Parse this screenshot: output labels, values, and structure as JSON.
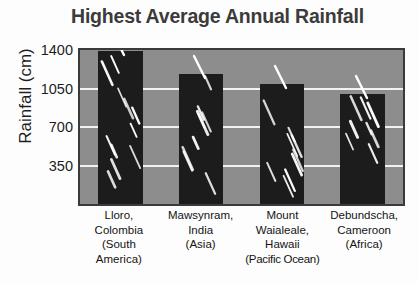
{
  "chart_data": {
    "type": "bar",
    "title": "Highest Average Annual Rainfall",
    "xlabel": "",
    "ylabel": "Rainfall (cm)",
    "ylim": [
      0,
      1400
    ],
    "yticks": [
      350,
      700,
      1050,
      1400
    ],
    "ytick_labels": [
      "350",
      "700",
      "1050",
      "1400"
    ],
    "gridlines": [
      350,
      700,
      1050
    ],
    "grid": true,
    "legend": "none",
    "categories": [
      "Lloro, Colombia (South America)",
      "Mawsynram, India (Asia)",
      "Mount Waialeale, Hawaii (Pacific Ocean)",
      "Debundscha, Cameroon (Africa)"
    ],
    "values": [
      1390,
      1180,
      1090,
      1000
    ],
    "bar_fill_color": "#1c1c1c",
    "plot_background_color": "#8d8d8d",
    "gridline_color": "#f2f2f2",
    "title_color": "#3b3b3b"
  },
  "axis": {
    "y_title": "Rainfall (cm)",
    "ticks": [
      {
        "label": "1400",
        "value": 1400
      },
      {
        "label": "1050",
        "value": 1050
      },
      {
        "label": "700",
        "value": 700
      },
      {
        "label": "350",
        "value": 350
      }
    ]
  },
  "categories": [
    {
      "name": "lloro-colombia",
      "lines": [
        "Lloro,",
        "Colombia",
        "(South",
        "America)"
      ]
    },
    {
      "name": "mawsynram-india",
      "lines": [
        "Mawsynram,",
        "India",
        "(Asia)"
      ]
    },
    {
      "name": "mount-waialeale-hawaii",
      "lines": [
        "Mount",
        "Waialeale,",
        "Hawaii",
        "(Pacific Ocean)"
      ]
    },
    {
      "name": "debundscha-cameroon",
      "lines": [
        "Debundscha,",
        "Cameroon",
        "(Africa)"
      ]
    }
  ]
}
